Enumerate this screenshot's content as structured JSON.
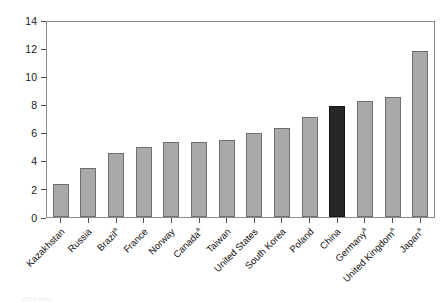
{
  "chart_data": {
    "type": "bar",
    "title": "",
    "subtitle": "",
    "xlabel": "",
    "ylabel": "",
    "ylim": [
      0,
      14
    ],
    "ytick_step": 2,
    "yticks": [
      "0",
      "2",
      "4",
      "6",
      "8",
      "10",
      "12",
      "14"
    ],
    "grid": false,
    "legend": null,
    "categories": [
      "Kazakhstan",
      "Russia",
      "Brazil",
      "France",
      "Norway",
      "Canada",
      "Taiwan",
      "United States",
      "South Korea",
      "Poland",
      "China",
      "Germany",
      "United Kingdom",
      "Japan"
    ],
    "category_footnote_markers": [
      "",
      "",
      "a",
      "",
      "",
      "a",
      "",
      "",
      "",
      "",
      "",
      "a",
      "a",
      "a"
    ],
    "values": [
      2.4,
      3.5,
      4.6,
      5.0,
      5.4,
      5.4,
      5.5,
      6.0,
      6.4,
      7.2,
      8.0,
      8.3,
      8.6,
      11.9
    ],
    "highlight_category": "China",
    "colors": {
      "bar_fill": "#a9a9a9",
      "bar_stroke": "#6f6f6f",
      "highlight_fill": "#262626",
      "highlight_stroke": "#141414",
      "axis": "#8a8a8a",
      "tick": "#4d4d4d",
      "text": "#111111",
      "background": "#ffffff"
    }
  },
  "footnote": {
    "text": "2010 data"
  }
}
